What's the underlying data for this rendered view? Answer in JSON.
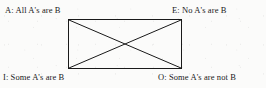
{
  "diagram": {
    "name": "square-of-opposition",
    "background_color": "#fbfbfa",
    "stroke_color": "#1a1a1a",
    "text_color": "#1a1a1a",
    "rect": {
      "x": 68,
      "y": 19,
      "width": 114,
      "height": 50
    },
    "diagonals": [
      {
        "from": "top-left",
        "to": "bottom-right"
      },
      {
        "from": "top-right",
        "to": "bottom-left"
      }
    ],
    "corners": {
      "top_left": {
        "letter": "A",
        "text": "A: All A's are B"
      },
      "top_right": {
        "letter": "E",
        "text": "E: No A's are B"
      },
      "bottom_left": {
        "letter": "I",
        "text": "I: Some A's are B"
      },
      "bottom_right": {
        "letter": "O",
        "text": "O: Some A's are not B"
      }
    }
  }
}
